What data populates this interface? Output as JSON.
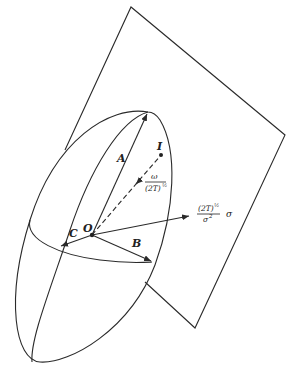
{
  "figure": {
    "type": "Poinsot ellipsoid rolling on invariable plane",
    "labels": {
      "A": "A",
      "B": "B",
      "C": "C",
      "O": "O",
      "I": "I",
      "omega_num": "ω",
      "omega_den": "(2T)",
      "omega_den_exp": "½",
      "sigma_num": "(2T)",
      "sigma_num_exp": "½",
      "sigma_den": "σ",
      "sigma_den_exp": "2",
      "sigma_suffix": "σ"
    },
    "points": {
      "O": [
        92,
        235
      ],
      "I": [
        161,
        155
      ],
      "A_tip": [
        148,
        112
      ],
      "B_tip": [
        152,
        262
      ],
      "C_tip": [
        60,
        246
      ],
      "sigma_tip": [
        190,
        216
      ]
    },
    "plane_corners": [
      [
        131,
        7
      ],
      [
        285,
        135
      ],
      [
        195,
        328
      ]
    ],
    "colors": {
      "stroke": "#2a2a2a",
      "background": "#ffffff"
    }
  }
}
